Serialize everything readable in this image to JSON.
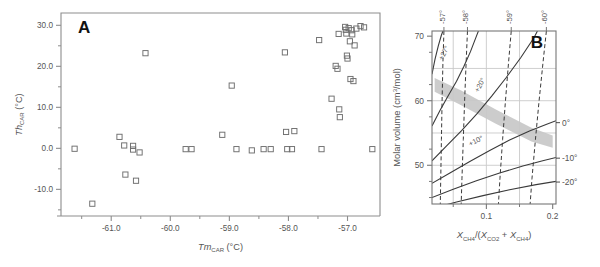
{
  "figure": {
    "width": 600,
    "height": 267,
    "background": "#ffffff",
    "panels": [
      "A",
      "B"
    ]
  },
  "panel_a": {
    "letter": "A",
    "axis": {
      "x_title_main": "Tm",
      "x_title_sub": "CAR",
      "x_title_unit": " (°C)",
      "x_title_full": "TmCAR (°C)",
      "y_title_main": "Th",
      "y_title_sub": "CAR",
      "y_title_unit": " (°C)",
      "y_title_full": "ThCAR (°C)",
      "x_ticks": [
        "-61.0",
        "-60.0",
        "-59.0",
        "-58.0",
        "-57.0"
      ],
      "x_tick_values": [
        -61.0,
        -60.0,
        -59.0,
        -58.0,
        -57.0
      ],
      "x_minor_values": [
        -61.5,
        -60.5,
        -59.5,
        -58.5,
        -57.5
      ],
      "y_ticks": [
        "30.0",
        "20.0",
        "10.0",
        "0.0",
        "-10.0"
      ],
      "y_tick_values": [
        30.0,
        20.0,
        10.0,
        0.0,
        -10.0
      ],
      "y_minor_values": [
        25.0,
        15.0,
        5.0,
        -5.0,
        -15.0
      ],
      "xlim": [
        -61.85,
        -56.45
      ],
      "ylim": [
        -16.5,
        33.0
      ],
      "frame_color": "#888888",
      "marker": "open-square",
      "marker_color": "#666666"
    }
  },
  "panel_b": {
    "letter": "B",
    "axis": {
      "x_title_full": "XCH4/(XCO2 + XCH4)",
      "y_title_full": "Molar volume (cm3/mol)",
      "x_ticks": [
        "0.1",
        "0.2"
      ],
      "x_tick_values": [
        0.1,
        0.2
      ],
      "x_minor_values": [
        0.05,
        0.15
      ],
      "y_ticks": [
        "70",
        "60",
        "50"
      ],
      "y_tick_values": [
        70,
        60,
        50
      ],
      "xlim": [
        0.018,
        0.205
      ],
      "ylim": [
        44.0,
        70.8
      ],
      "grid_x": [
        0.05,
        0.1,
        0.15
      ],
      "grid_y": [
        65,
        60,
        55,
        50
      ],
      "grid_color": "#c9c9c9",
      "frame_color": "#777777"
    },
    "isotherm_labels_top": [
      "-57°",
      "-58°",
      "-59°",
      "-60°"
    ],
    "homog_labels_inside": [
      "+27°",
      "+20°",
      "+10°"
    ],
    "homog_labels_right": [
      "0°",
      "-10°",
      "-20°"
    ],
    "shaded_band": {
      "color": "#c8c8c8",
      "description": "gray trend band sloping down to the right"
    }
  },
  "chart_data": [
    {
      "type": "scatter",
      "panel": "A",
      "title": "A",
      "xlabel": "TmCAR (°C)",
      "ylabel": "ThCAR (°C)",
      "xlim": [
        -61.85,
        -56.45
      ],
      "ylim": [
        -16.5,
        33.0
      ],
      "grid": false,
      "legend": "none",
      "marker": "open square",
      "points": [
        [
          -61.62,
          -0.1
        ],
        [
          -61.32,
          -13.5
        ],
        [
          -60.86,
          2.8
        ],
        [
          -60.78,
          0.7
        ],
        [
          -60.76,
          -6.4
        ],
        [
          -60.63,
          0.6
        ],
        [
          -60.63,
          -0.3
        ],
        [
          -60.58,
          -7.9
        ],
        [
          -60.52,
          -1.0
        ],
        [
          -60.42,
          23.2
        ],
        [
          -59.74,
          -0.2
        ],
        [
          -59.64,
          -0.2
        ],
        [
          -59.12,
          3.3
        ],
        [
          -58.96,
          15.3
        ],
        [
          -58.88,
          -0.2
        ],
        [
          -58.62,
          -0.5
        ],
        [
          -58.42,
          -0.2
        ],
        [
          -58.3,
          -0.2
        ],
        [
          -58.06,
          23.4
        ],
        [
          -58.04,
          4.0
        ],
        [
          -58.02,
          -0.2
        ],
        [
          -57.94,
          -0.2
        ],
        [
          -57.9,
          4.2
        ],
        [
          -57.48,
          26.4
        ],
        [
          -57.44,
          -0.2
        ],
        [
          -57.27,
          12.1
        ],
        [
          -57.2,
          20.1
        ],
        [
          -57.17,
          19.4
        ],
        [
          -57.15,
          27.9
        ],
        [
          -57.14,
          9.5
        ],
        [
          -57.13,
          7.6
        ],
        [
          -57.04,
          29.6
        ],
        [
          -57.03,
          28.9
        ],
        [
          -57.02,
          28.0
        ],
        [
          -57.01,
          22.6
        ],
        [
          -57.0,
          21.9
        ],
        [
          -56.98,
          29.3
        ],
        [
          -56.96,
          26.1
        ],
        [
          -56.95,
          16.9
        ],
        [
          -56.93,
          28.8
        ],
        [
          -56.92,
          27.8
        ],
        [
          -56.9,
          16.4
        ],
        [
          -56.88,
          25.1
        ],
        [
          -56.85,
          29.2
        ],
        [
          -56.78,
          29.8
        ],
        [
          -56.72,
          29.5
        ],
        [
          -56.58,
          -0.2
        ]
      ]
    },
    {
      "type": "line",
      "panel": "B",
      "title": "B",
      "xlabel": "XCH4/(XCO2 + XCH4)",
      "ylabel": "Molar volume (cm3/mol)",
      "xlim": [
        0.018,
        0.205
      ],
      "ylim": [
        44.0,
        70.8
      ],
      "grid": true,
      "legend": "inline-labels",
      "series": [
        {
          "name": "-57°",
          "style": "dashed",
          "kind": "melting-isotherm",
          "points": [
            [
              0.036,
              70.8
            ],
            [
              0.0345,
              66.0
            ],
            [
              0.0332,
              60.0
            ],
            [
              0.0322,
              54.0
            ],
            [
              0.0312,
              48.0
            ],
            [
              0.0305,
              44.0
            ]
          ]
        },
        {
          "name": "-58°",
          "style": "dashed",
          "kind": "melting-isotherm",
          "points": [
            [
              0.0715,
              70.8
            ],
            [
              0.0695,
              66.0
            ],
            [
              0.0672,
              60.0
            ],
            [
              0.0652,
              54.0
            ],
            [
              0.0632,
              48.0
            ],
            [
              0.062,
              44.0
            ]
          ]
        },
        {
          "name": "-59°",
          "style": "dashed",
          "kind": "melting-isotherm",
          "points": [
            [
              0.1375,
              70.8
            ],
            [
              0.1335,
              66.0
            ],
            [
              0.1288,
              60.0
            ],
            [
              0.1245,
              54.0
            ],
            [
              0.1205,
              48.0
            ],
            [
              0.1182,
              44.0
            ]
          ]
        },
        {
          "name": "-60°",
          "style": "dashed",
          "kind": "melting-isotherm",
          "points": [
            [
              0.1905,
              70.8
            ],
            [
              0.1855,
              66.0
            ],
            [
              0.1795,
              60.0
            ],
            [
              0.174,
              54.0
            ],
            [
              0.1688,
              48.0
            ],
            [
              0.166,
              44.0
            ]
          ]
        },
        {
          "name": "+27°",
          "style": "solid",
          "kind": "homogenization-isochore",
          "points": [
            [
              0.018,
              64.1
            ],
            [
              0.0225,
              66.4
            ],
            [
              0.0275,
              68.5
            ],
            [
              0.032,
              70.1
            ],
            [
              0.0345,
              70.8
            ]
          ]
        },
        {
          "name": "+20°",
          "style": "solid",
          "kind": "homogenization-isochore",
          "points": [
            [
              0.018,
              56.1
            ],
            [
              0.03,
              58.5
            ],
            [
              0.042,
              60.7
            ],
            [
              0.055,
              63.0
            ],
            [
              0.066,
              65.3
            ],
            [
              0.076,
              67.6
            ],
            [
              0.085,
              70.0
            ],
            [
              0.088,
              70.8
            ]
          ]
        },
        {
          "name": "+10°",
          "style": "solid",
          "kind": "homogenization-isochore",
          "points": [
            [
              0.018,
              50.7
            ],
            [
              0.04,
              53.0
            ],
            [
              0.063,
              55.4
            ],
            [
              0.086,
              58.0
            ],
            [
              0.108,
              60.7
            ],
            [
              0.13,
              63.6
            ],
            [
              0.152,
              66.7
            ],
            [
              0.172,
              69.8
            ],
            [
              0.177,
              70.8
            ]
          ]
        },
        {
          "name": "0°",
          "style": "solid",
          "kind": "homogenization-isochore",
          "points": [
            [
              0.018,
              47.2
            ],
            [
              0.045,
              48.8
            ],
            [
              0.075,
              50.6
            ],
            [
              0.105,
              52.3
            ],
            [
              0.135,
              53.9
            ],
            [
              0.165,
              55.3
            ],
            [
              0.19,
              56.3
            ],
            [
              0.205,
              56.9
            ]
          ]
        },
        {
          "name": "-10°",
          "style": "solid",
          "kind": "homogenization-isochore",
          "points": [
            [
              0.018,
              45.0
            ],
            [
              0.05,
              46.3
            ],
            [
              0.085,
              47.6
            ],
            [
              0.12,
              48.8
            ],
            [
              0.155,
              49.9
            ],
            [
              0.185,
              50.7
            ],
            [
              0.205,
              51.2
            ]
          ]
        },
        {
          "name": "-20°",
          "style": "solid",
          "kind": "homogenization-isochore",
          "points": [
            [
              0.018,
              43.3
            ],
            [
              0.055,
              44.3
            ],
            [
              0.095,
              45.3
            ],
            [
              0.135,
              46.2
            ],
            [
              0.175,
              47.0
            ],
            [
              0.205,
              47.5
            ]
          ]
        }
      ],
      "shaded_band": {
        "name": "data-trend-band",
        "color": "#c8c8c8",
        "upper": [
          [
            0.022,
            63.5
          ],
          [
            0.062,
            61.6
          ],
          [
            0.115,
            58.6
          ],
          [
            0.168,
            55.8
          ],
          [
            0.2,
            54.6
          ]
        ],
        "lower": [
          [
            0.022,
            61.4
          ],
          [
            0.062,
            59.3
          ],
          [
            0.115,
            56.4
          ],
          [
            0.168,
            53.7
          ],
          [
            0.2,
            52.7
          ]
        ]
      }
    }
  ]
}
